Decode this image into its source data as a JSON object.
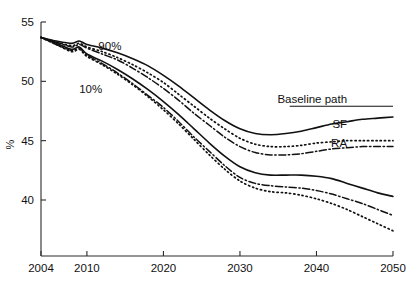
{
  "chart_data": {
    "type": "line",
    "title": "",
    "subtitle": "",
    "xlabel": "",
    "ylabel": "%",
    "xlim": [
      2004,
      2050
    ],
    "ylim": [
      36.5,
      55.5
    ],
    "xticks": [
      2004,
      2010,
      2020,
      2030,
      2040,
      2050
    ],
    "xticklabels": [
      "2004",
      "2010",
      "2020",
      "2030",
      "2040",
      "2050"
    ],
    "yticks": [
      40,
      45,
      50,
      55
    ],
    "yticklabels": [
      "40",
      "45",
      "50",
      "55"
    ],
    "grid": false,
    "legend_position": "inline-right-annotations",
    "x": [
      2004,
      2006,
      2008,
      2009,
      2010,
      2012,
      2014,
      2016,
      2018,
      2020,
      2022,
      2024,
      2026,
      2028,
      2030,
      2032,
      2034,
      2036,
      2038,
      2040,
      2042,
      2044,
      2046,
      2048,
      2050
    ],
    "series": [
      {
        "name": "Baseline path 90%",
        "label": "Baseline path",
        "band": "90%",
        "style": "solid",
        "values": [
          53.7,
          53.4,
          53.2,
          53.4,
          53.1,
          52.8,
          52.4,
          51.9,
          51.3,
          50.5,
          49.6,
          48.6,
          47.6,
          46.7,
          46.0,
          45.6,
          45.5,
          45.6,
          45.8,
          46.1,
          46.4,
          46.6,
          46.8,
          46.9,
          47.0
        ]
      },
      {
        "name": "SF 90%",
        "label": "SF",
        "band": "90%",
        "style": "dotted",
        "values": [
          53.7,
          53.3,
          53.0,
          53.2,
          52.9,
          52.5,
          52.0,
          51.4,
          50.7,
          49.9,
          48.9,
          47.9,
          46.9,
          46.0,
          45.2,
          44.7,
          44.5,
          44.5,
          44.6,
          44.8,
          44.9,
          45.0,
          45.0,
          45.0,
          45.0
        ]
      },
      {
        "name": "RA 90%",
        "label": "RA",
        "band": "90%",
        "style": "dashdot",
        "values": [
          53.7,
          53.3,
          52.9,
          53.1,
          52.8,
          52.3,
          51.8,
          51.1,
          50.3,
          49.4,
          48.4,
          47.3,
          46.3,
          45.3,
          44.5,
          44.0,
          43.8,
          43.8,
          43.9,
          44.1,
          44.3,
          44.4,
          44.5,
          44.5,
          44.5
        ]
      },
      {
        "name": "Baseline path 10%",
        "label": "Baseline path",
        "band": "10%",
        "style": "solid",
        "values": [
          53.7,
          53.2,
          52.7,
          52.9,
          52.3,
          51.7,
          51.0,
          50.2,
          49.3,
          48.3,
          47.2,
          46.0,
          44.8,
          43.7,
          42.8,
          42.3,
          42.1,
          42.1,
          42.1,
          42.0,
          41.8,
          41.4,
          41.0,
          40.6,
          40.3
        ]
      },
      {
        "name": "SF 10%",
        "label": "SF",
        "band": "10%",
        "style": "dotted",
        "values": [
          53.7,
          53.1,
          52.5,
          52.7,
          52.1,
          51.4,
          50.6,
          49.7,
          48.7,
          47.6,
          46.4,
          45.1,
          43.8,
          42.6,
          41.6,
          41.0,
          40.7,
          40.6,
          40.4,
          40.1,
          39.7,
          39.2,
          38.6,
          38.0,
          37.4
        ]
      },
      {
        "name": "RA 10%",
        "label": "RA",
        "band": "10%",
        "style": "dashdot",
        "values": [
          53.7,
          53.1,
          52.6,
          52.8,
          52.2,
          51.5,
          50.7,
          49.8,
          48.8,
          47.8,
          46.6,
          45.3,
          44.1,
          42.9,
          41.9,
          41.4,
          41.2,
          41.1,
          41.0,
          40.8,
          40.5,
          40.1,
          39.7,
          39.2,
          38.7
        ]
      }
    ],
    "annotations": [
      {
        "text": "90%",
        "x": 2013,
        "y": 52.6
      },
      {
        "text": "10%",
        "x": 2010.5,
        "y": 49.0
      },
      {
        "text": "Baseline path",
        "x": 2044,
        "y": 48.2
      },
      {
        "text": "SF",
        "x": 2044,
        "y": 46.1
      },
      {
        "text": "RA",
        "x": 2044,
        "y": 44.5
      }
    ]
  }
}
